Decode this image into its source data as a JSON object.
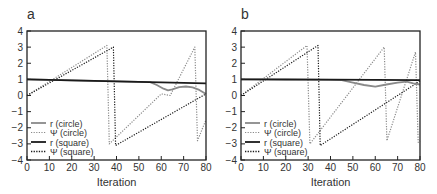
{
  "chart_data": [
    {
      "panel_label": "a",
      "type": "line",
      "title": "",
      "xlabel": "Iteration",
      "ylabel": "",
      "xlim": [
        0,
        80
      ],
      "ylim": [
        -4,
        4
      ],
      "xticks": [
        0,
        10,
        20,
        30,
        40,
        50,
        60,
        70,
        80
      ],
      "yticks": [
        -4,
        -3,
        -2,
        -1,
        0,
        1,
        2,
        3,
        4
      ],
      "grid": false,
      "legend_position": "lower left",
      "series": [
        {
          "name": "r (circle)",
          "style": "solid",
          "color": "#8a8a8a",
          "x": [
            0,
            10,
            20,
            30,
            40,
            50,
            55,
            58,
            61,
            63,
            65,
            68,
            71,
            74,
            77,
            80
          ],
          "y": [
            1.0,
            0.97,
            0.94,
            0.91,
            0.88,
            0.85,
            0.83,
            0.65,
            0.42,
            0.32,
            0.38,
            0.52,
            0.56,
            0.5,
            0.35,
            0.1
          ]
        },
        {
          "name": "Ψ (circle)",
          "style": "dotted",
          "color": "#8a8a8a",
          "x": [
            0,
            35.7,
            36.8,
            60,
            64,
            75,
            76.2,
            80
          ],
          "y": [
            0,
            3.1,
            -3.0,
            0.1,
            0.0,
            3.0,
            -2.8,
            -1.5
          ]
        },
        {
          "name": "r (square)",
          "style": "solid",
          "color": "#1a1a1a",
          "x": [
            0,
            80
          ],
          "y": [
            1.0,
            0.75
          ]
        },
        {
          "name": "Ψ (square)",
          "style": "dotted",
          "color": "#1a1a1a",
          "x": [
            0,
            38.6,
            39.6,
            80
          ],
          "y": [
            0,
            3.0,
            -3.1,
            0.1
          ]
        }
      ]
    },
    {
      "panel_label": "b",
      "type": "line",
      "title": "",
      "xlabel": "Iteration",
      "ylabel": "",
      "xlim": [
        0,
        80
      ],
      "ylim": [
        -4,
        4
      ],
      "xticks": [
        0,
        10,
        20,
        30,
        40,
        50,
        60,
        70,
        80
      ],
      "yticks": [
        -4,
        -3,
        -2,
        -1,
        0,
        1,
        2,
        3,
        4
      ],
      "grid": false,
      "legend_position": "lower left",
      "series": [
        {
          "name": "r (circle)",
          "style": "solid",
          "color": "#8a8a8a",
          "x": [
            0,
            10,
            20,
            30,
            40,
            45,
            50,
            55,
            60,
            65,
            70,
            74,
            77,
            80
          ],
          "y": [
            1.0,
            1.0,
            0.99,
            0.98,
            0.97,
            0.95,
            0.8,
            0.65,
            0.55,
            0.68,
            0.8,
            0.86,
            0.75,
            0.68
          ]
        },
        {
          "name": "Ψ (circle)",
          "style": "dotted",
          "color": "#8a8a8a",
          "x": [
            0,
            29.5,
            30.8,
            64,
            65.2,
            78,
            79.2,
            80
          ],
          "y": [
            0,
            3.1,
            -3.0,
            3.0,
            -2.8,
            2.7,
            -2.9,
            -2.8
          ]
        },
        {
          "name": "r (square)",
          "style": "solid",
          "color": "#1a1a1a",
          "x": [
            0,
            40,
            80
          ],
          "y": [
            1.0,
            0.98,
            0.95
          ]
        },
        {
          "name": "Ψ (square)",
          "style": "dotted",
          "color": "#1a1a1a",
          "x": [
            0,
            34.4,
            35.4,
            80
          ],
          "y": [
            0,
            3.1,
            -3.1,
            0.9
          ]
        }
      ]
    }
  ],
  "panels": [
    {
      "label": "a",
      "xlabel": "Iteration",
      "legend": [
        "r (circle)",
        "Ψ (circle)",
        "r (square)",
        "Ψ (square)"
      ]
    },
    {
      "label": "b",
      "xlabel": "Iteration",
      "legend": [
        "r (circle)",
        "Ψ (circle)",
        "r (square)",
        "Ψ (square)"
      ]
    }
  ]
}
